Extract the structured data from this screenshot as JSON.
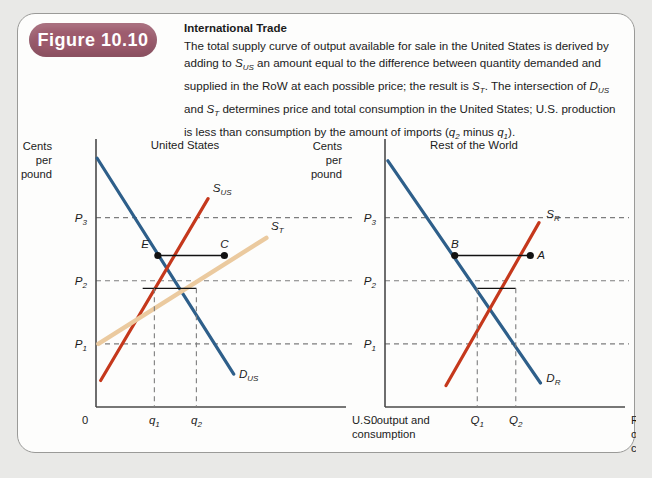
{
  "figure": {
    "badge_label": "Figure 10.10",
    "title": "International Trade",
    "caption_segments": [
      {
        "t": "The total supply curve of output available for sale in the United States is derived by adding to ",
        "s": "plain"
      },
      {
        "t": "S",
        "s": "italic"
      },
      {
        "t": "US",
        "s": "sub"
      },
      {
        "t": " an amount equal to the difference between quantity demanded and supplied in the RoW at each possible price; the result is ",
        "s": "plain"
      },
      {
        "t": "S",
        "s": "italic"
      },
      {
        "t": "T",
        "s": "sub"
      },
      {
        "t": ". The intersection of ",
        "s": "plain"
      },
      {
        "t": "D",
        "s": "italic"
      },
      {
        "t": "US",
        "s": "sub"
      },
      {
        "t": " and ",
        "s": "plain"
      },
      {
        "t": "S",
        "s": "italic"
      },
      {
        "t": "T",
        "s": "sub"
      },
      {
        "t": " determines price and total consumption in the United States; U.S. production is less than consumption by the amount of imports (",
        "s": "plain"
      },
      {
        "t": "q",
        "s": "italic"
      },
      {
        "t": "2",
        "s": "sub"
      },
      {
        "t": " minus ",
        "s": "plain"
      },
      {
        "t": "q",
        "s": "italic"
      },
      {
        "t": "1",
        "s": "sub"
      },
      {
        "t": ").",
        "s": "plain"
      }
    ],
    "caption_plain": "The total supply curve of output available for sale in the United States is derived by adding to S_US an amount equal to the difference between quantity demanded and supplied in the RoW at each possible price; the result is S_T. The intersection of D_US and S_T determines price and total consumption in the United States; U.S. production is less than consumption by the amount of imports (q_2 minus q_1)."
  },
  "colors": {
    "badge": "#9d5b6d",
    "demand_blue": "#2e5f8a",
    "supply_red": "#c5381c",
    "total_supply_tan": "#ebca9f",
    "axis_gray": "#4a4a4a",
    "guide_gray": "#7d7d7d",
    "point_black": "#121212",
    "frame_border": "#9a9a98",
    "page_background": "#e9e9e7",
    "panel_background": "#fdfdfc"
  },
  "chart_data": [
    {
      "type": "line",
      "panel": "a",
      "panel_tag": "(a)",
      "title": "United States",
      "ylabel_lines": [
        "Cents",
        "per",
        "pound"
      ],
      "xlabel_lines": [
        "U.S. output and",
        "consumption"
      ],
      "origin_label": "0",
      "ytick_labels": [
        "P3",
        "P2",
        "P1"
      ],
      "ytick_values": [
        3,
        2,
        1
      ],
      "xtick_labels": [
        "q1",
        "q2"
      ],
      "xtick_values": [
        1,
        2
      ],
      "grid": false,
      "legend_position": "inline-curve-labels",
      "series": [
        {
          "name": "D_US",
          "label": "D",
          "label_sub": "US",
          "color": "#2e5f8a",
          "points": [
            [
              0.02,
              3.94
            ],
            [
              2.36,
              0.52
            ]
          ]
        },
        {
          "name": "S_US",
          "label": "S",
          "label_sub": "US",
          "color": "#c5381c",
          "points": [
            [
              0.08,
              0.42
            ],
            [
              1.92,
              3.3
            ]
          ]
        },
        {
          "name": "S_T",
          "label": "S",
          "label_sub": "T",
          "color": "#ebca9f",
          "points": [
            [
              0.04,
              1.0
            ],
            [
              2.92,
              2.68
            ]
          ]
        }
      ],
      "marked_points": [
        {
          "label": "E",
          "x": 1.06,
          "y": 2.4,
          "label_pos": "above-left"
        },
        {
          "label": "C",
          "x": 2.2,
          "y": 2.4,
          "label_pos": "above"
        }
      ],
      "price_links": [
        {
          "price_label": "P3",
          "y": 2.4,
          "x_from": 1.06,
          "x_to": 2.2
        },
        {
          "price_label": "P2",
          "y": 1.88,
          "x_from": 0.8,
          "x_to": 1.72
        }
      ],
      "drop_lines": [
        {
          "x": 1.0,
          "y_top": 1.88,
          "tick": "q1"
        },
        {
          "x": 1.72,
          "y_top": 1.88,
          "tick": "q2"
        }
      ]
    },
    {
      "type": "line",
      "panel": "b",
      "panel_tag": "(b)",
      "title": "Rest of the World",
      "ylabel_lines": [
        "Cents",
        "per",
        "pound"
      ],
      "xlabel_lines": [
        "Rest of World",
        "output and",
        "consumption"
      ],
      "origin_label": "0",
      "ytick_labels": [
        "P3",
        "P2",
        "P1"
      ],
      "ytick_values": [
        3,
        2,
        1
      ],
      "xtick_labels": [
        "Q1",
        "Q2"
      ],
      "xtick_values": [
        1,
        2
      ],
      "grid": false,
      "legend_position": "inline-curve-labels",
      "series": [
        {
          "name": "D_R",
          "label": "D",
          "label_sub": "R",
          "color": "#2e5f8a",
          "points": [
            [
              0.04,
              3.9
            ],
            [
              2.14,
              0.38
            ]
          ]
        },
        {
          "name": "S_R",
          "label": "S",
          "label_sub": "R",
          "color": "#c5381c",
          "points": [
            [
              0.84,
              0.34
            ],
            [
              2.12,
              2.92
            ]
          ]
        }
      ],
      "marked_points": [
        {
          "label": "B",
          "x": 0.96,
          "y": 2.4,
          "label_pos": "above"
        },
        {
          "label": "A",
          "x": 2.0,
          "y": 2.4,
          "label_pos": "right"
        }
      ],
      "price_links": [
        {
          "price_label": "P3",
          "y": 2.4,
          "x_from": 0.96,
          "x_to": 2.0
        },
        {
          "price_label": "P2",
          "y": 1.88,
          "x_from": 1.27,
          "x_to": 1.8
        }
      ],
      "drop_lines": [
        {
          "x": 1.27,
          "y_top": 1.88,
          "tick": "Q1"
        },
        {
          "x": 1.8,
          "y_top": 1.88,
          "tick": "Q2"
        }
      ]
    }
  ]
}
